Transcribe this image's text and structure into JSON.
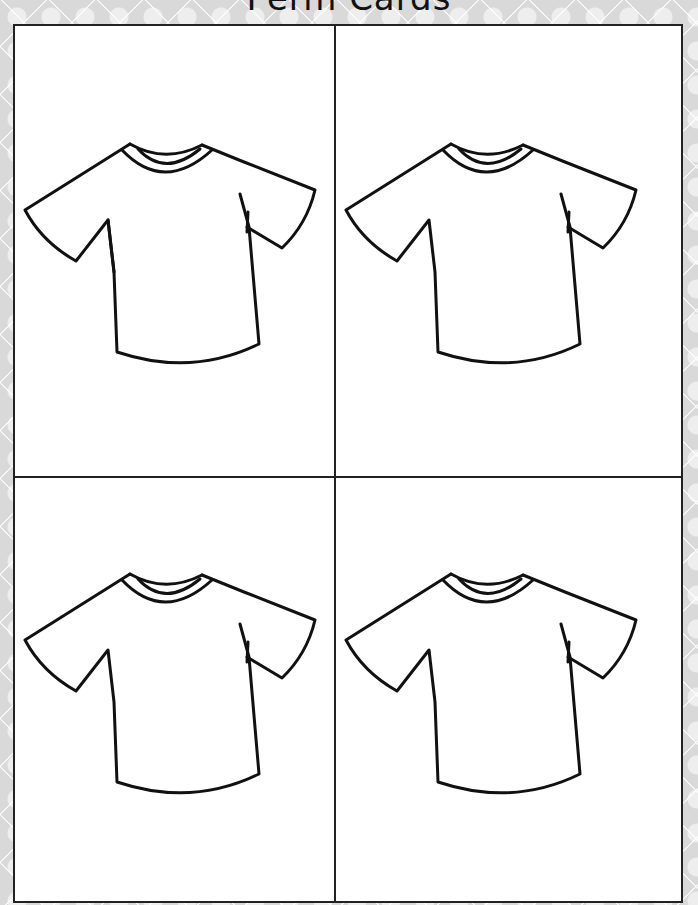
{
  "title": "Perm Cards",
  "cards": [
    {
      "label": "T-shirt outline card 1",
      "icon": "tshirt-icon"
    },
    {
      "label": "T-shirt outline card 2",
      "icon": "tshirt-icon"
    },
    {
      "label": "T-shirt outline card 3",
      "icon": "tshirt-icon"
    },
    {
      "label": "T-shirt outline card 4",
      "icon": "tshirt-icon"
    }
  ],
  "colors": {
    "line": "#111111",
    "paper": "#ffffff",
    "background": "#d9d9d9"
  }
}
